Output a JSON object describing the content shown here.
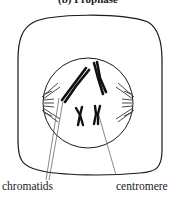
{
  "heading": "(b) Prophase",
  "labels": {
    "chromatids": "chromatids",
    "centromere": "centromere"
  },
  "colors": {
    "stroke": "#1a1a1a",
    "leader": "#555555",
    "background": "#ffffff"
  }
}
